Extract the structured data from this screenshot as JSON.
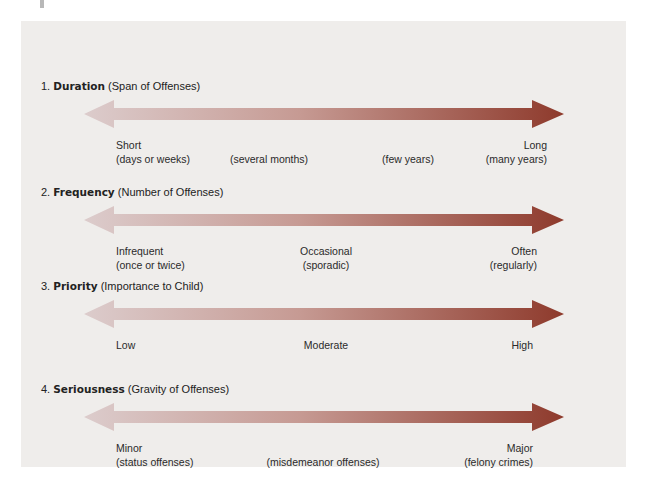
{
  "colors": {
    "background": "#ffffff",
    "panel": "#efedeb",
    "arrow_light": "#d9c9c9",
    "arrow_dark": "#8e3a2c",
    "text": "#222222"
  },
  "dimensions": [
    {
      "number": "1.",
      "name": "Duration",
      "subtitle": "(Span of Offenses)",
      "labels": [
        {
          "line1": "Short",
          "line2": "(days or weeks)"
        },
        {
          "line1": "",
          "line2": "(several months)"
        },
        {
          "line1": "",
          "line2": "(few years)"
        },
        {
          "line1": "Long",
          "line2": "(many years)"
        }
      ]
    },
    {
      "number": "2.",
      "name": "Frequency",
      "subtitle": "(Number of Offenses)",
      "labels": [
        {
          "line1": "Infrequent",
          "line2": "(once or twice)"
        },
        {
          "line1": "Occasional",
          "line2": "(sporadic)"
        },
        {
          "line1": "Often",
          "line2": "(regularly)"
        }
      ]
    },
    {
      "number": "3.",
      "name": "Priority",
      "subtitle": "(Importance to Child)",
      "labels": [
        {
          "line1": "Low",
          "line2": ""
        },
        {
          "line1": "Moderate",
          "line2": ""
        },
        {
          "line1": "High",
          "line2": ""
        }
      ]
    },
    {
      "number": "4.",
      "name": "Seriousness",
      "subtitle": "(Gravity of Offenses)",
      "labels": [
        {
          "line1": "Minor",
          "line2": "(status offenses)"
        },
        {
          "line1": "",
          "line2": "(misdemeanor offenses)"
        },
        {
          "line1": "Major",
          "line2": "(felony crimes)"
        }
      ]
    }
  ],
  "icons": {
    "arrow": "double-headed-gradient-arrow"
  }
}
